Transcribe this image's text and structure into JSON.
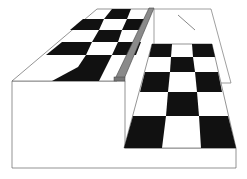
{
  "diagram": {
    "elements": [
      "upper-checkerboard-plane",
      "lower-checkerboard-plane",
      "gray-rod",
      "box-front-face",
      "background-panel",
      "diagonal-line"
    ],
    "colors": {
      "black": "#111111",
      "white": "#ffffff",
      "rod": "#8a8a8a",
      "stroke": "#555555"
    }
  }
}
